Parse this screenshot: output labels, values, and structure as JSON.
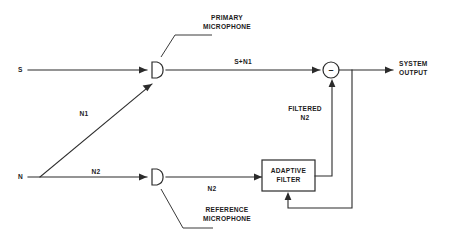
{
  "figure": {
    "kind": "block-diagram",
    "title_visible": false,
    "background_color": "#ffffff",
    "line_color": "#2b2b2b",
    "text_color": "#1c1c1c"
  },
  "inputs": {
    "signal_label": "S",
    "noise_label": "N"
  },
  "edge_labels": {
    "noise_to_primary": "N1",
    "noise_to_reference": "N2",
    "reference_to_filter": "N2",
    "primary_sum": "S+N1",
    "filtered_noise_line1": "FILTERED",
    "filtered_noise_line2": "N2"
  },
  "nodes": {
    "primary_microphone": {
      "caption_line1": "PRIMARY",
      "caption_line2": "MICROPHONE"
    },
    "reference_microphone": {
      "caption_line1": "REFERENCE",
      "caption_line2": "MICROPHONE"
    },
    "adaptive_filter": {
      "line1": "ADAPTIVE",
      "line2": "FILTER"
    },
    "summing_junction": {
      "sign": "–"
    }
  },
  "output": {
    "line1": "SYSTEM",
    "line2": "OUTPUT"
  }
}
